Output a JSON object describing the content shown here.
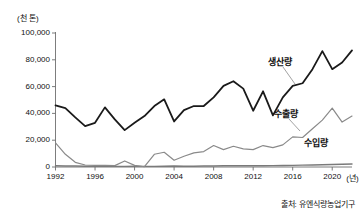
{
  "chart_data": {
    "type": "line",
    "title": "",
    "xlabel": "(년)",
    "ylabel": "(천 톤)",
    "x": [
      1992,
      1993,
      1994,
      1995,
      1996,
      1997,
      1998,
      1999,
      2000,
      2001,
      2002,
      2003,
      2004,
      2005,
      2006,
      2007,
      2008,
      2009,
      2010,
      2011,
      2012,
      2013,
      2014,
      2015,
      2016,
      2017,
      2018,
      2019,
      2020,
      2021,
      2022
    ],
    "xlim": [
      1992,
      2022
    ],
    "ylim": [
      0,
      100000
    ],
    "yticks": [
      0,
      20000,
      40000,
      60000,
      80000,
      100000
    ],
    "ytick_labels": [
      "0",
      "20,000",
      "40,000",
      "60,000",
      "80,000",
      "100,000"
    ],
    "xticks": [
      1992,
      1996,
      2000,
      2004,
      2008,
      2012,
      2016,
      2020
    ],
    "xtick_labels": [
      "1992",
      "1996",
      "2000",
      "2004",
      "2008",
      "2012",
      "2016",
      "2020"
    ],
    "grid": false,
    "legend_position": "inline-annotations",
    "series": [
      {
        "name": "생산량",
        "label": "생산량",
        "color": "#1a1a1a",
        "width": 1.8,
        "values": [
          46000,
          44000,
          37000,
          30500,
          33000,
          44500,
          35500,
          27500,
          33000,
          38000,
          45500,
          50500,
          34000,
          42500,
          45500,
          45500,
          52000,
          60500,
          64000,
          58500,
          42000,
          56500,
          38500,
          52000,
          60500,
          62500,
          73000,
          86500,
          73000,
          78000,
          87000
        ]
      },
      {
        "name": "수출량",
        "label": "수출량",
        "color": "#8a8a8a",
        "width": 1.2,
        "values": [
          18000,
          9500,
          3500,
          1500,
          1200,
          1200,
          1000,
          4500,
          1200,
          200,
          9500,
          11000,
          5000,
          8000,
          10500,
          11500,
          16000,
          13000,
          15500,
          13500,
          13000,
          16000,
          14500,
          16500,
          22500,
          22000,
          28500,
          35000,
          44000,
          33500,
          38000
        ]
      },
      {
        "name": "수입량",
        "label": "수입량",
        "color": "#7a7a7a",
        "width": 1.4,
        "values": [
          900,
          800,
          700,
          600,
          600,
          600,
          500,
          500,
          600,
          500,
          500,
          600,
          700,
          600,
          600,
          700,
          800,
          900,
          900,
          1000,
          900,
          900,
          1000,
          1100,
          1200,
          1400,
          1500,
          1700,
          1900,
          2000,
          2200
        ]
      }
    ],
    "annotations": [
      {
        "text": "생산량",
        "x": 268,
        "y": 55,
        "leader_from": [
          283,
          67
        ],
        "leader_to": [
          295,
          84
        ]
      },
      {
        "text": "수출량",
        "x": 274,
        "y": 107,
        "leader_from": [
          289,
          119
        ],
        "leader_to": [
          300,
          131
        ]
      },
      {
        "text": "수입량",
        "x": 304,
        "y": 136,
        "leader_from": null,
        "leader_to": null
      }
    ]
  },
  "source": {
    "text": "출처: 유엔식량농업기구"
  },
  "axes": {
    "unit_label": "(천 톤)",
    "x_unit_label": "(년)"
  },
  "colors": {
    "background": "#ffffff",
    "axis": "#6e6e6e",
    "text": "#1a1a1a",
    "production": "#1a1a1a",
    "export": "#8a8a8a",
    "import": "#7a7a7a"
  }
}
